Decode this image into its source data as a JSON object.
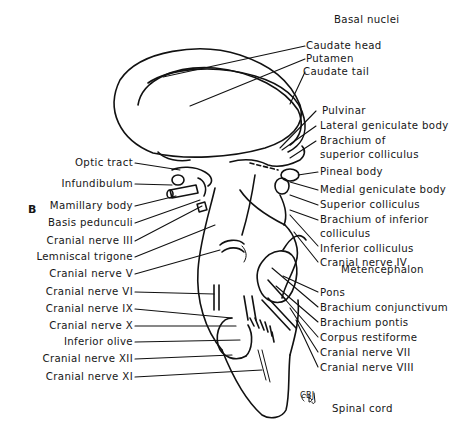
{
  "figure": {
    "panel_letter": "B",
    "signature": "CBJ",
    "region_headings": {
      "top": "Basal nuclei",
      "middle": "Metencephalon",
      "bottom": "Spinal cord"
    },
    "labels_right": [
      "Caudate head",
      "Putamen",
      "Caudate tail",
      "Pulvinar",
      "Lateral geniculate body",
      "Brachium of",
      "superior colliculus",
      "Pineal body",
      "Medial geniculate body",
      "Superior colliculus",
      "Brachium of inferior",
      "colliculus",
      "Inferior colliculus",
      "Cranial nerve IV",
      "Pons",
      "Brachium conjunctivum",
      "Brachium pontis",
      "Corpus restiforme",
      "Cranial nerve VII",
      "Cranial nerve VIII"
    ],
    "labels_left": [
      "Optic tract",
      "Infundibulum",
      "Mamillary body",
      "Basis pedunculi",
      "Cranial nerve III",
      "Lemniscal trigone",
      "Cranial nerve V",
      "Cranial nerve VI",
      "Cranial nerve IX",
      "Cranial nerve X",
      "Inferior olive",
      "Cranial nerve XII",
      "Cranial nerve XI"
    ],
    "colors": {
      "ink": "#111111",
      "background": "#ffffff"
    }
  }
}
